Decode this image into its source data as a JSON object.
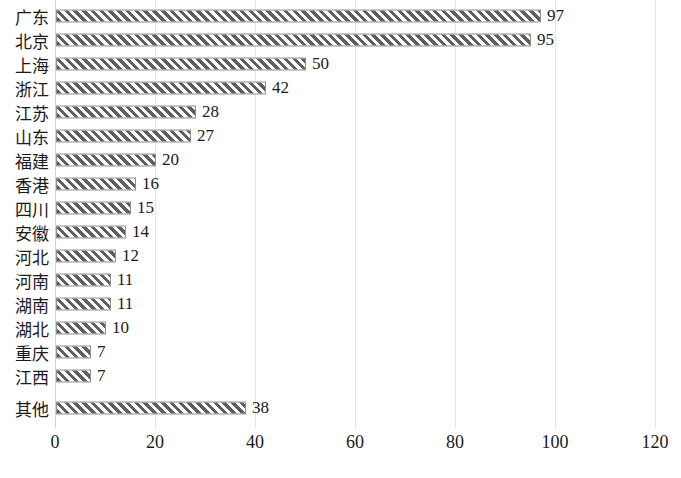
{
  "chart_data": {
    "type": "bar",
    "orientation": "horizontal",
    "title": "",
    "xlabel": "",
    "ylabel": "",
    "xlim": [
      0,
      120
    ],
    "xticks": [
      0,
      20,
      40,
      60,
      80,
      100,
      120
    ],
    "xtick_labels": [
      "0",
      "20",
      "40",
      "60",
      "80",
      "100",
      "120"
    ],
    "grid": "vertical",
    "legend": "none",
    "bar_style": {
      "fill": "diagonal-hatch",
      "hatch_color": "#5e5e5e",
      "background_color": "#ffffff",
      "border_color": "#8f8f8f"
    },
    "gridline_color": "#e4e4e4",
    "categories": [
      "广东",
      "北京",
      "上海",
      "浙江",
      "江苏",
      "山东",
      "福建",
      "香港",
      "四川",
      "安徽",
      "河北",
      "河南",
      "湖南",
      "湖北",
      "重庆",
      "江西",
      "其他"
    ],
    "values": [
      97,
      95,
      50,
      42,
      28,
      27,
      20,
      16,
      15,
      14,
      12,
      11,
      11,
      10,
      7,
      7,
      38
    ],
    "data_labels": [
      "97",
      "95",
      "50",
      "42",
      "28",
      "27",
      "20",
      "16",
      "15",
      "14",
      "12",
      "11",
      "11",
      "10",
      "7",
      "7",
      "38"
    ]
  }
}
